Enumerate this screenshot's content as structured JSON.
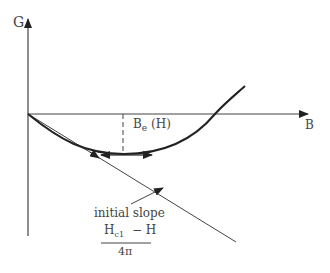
{
  "diagram": {
    "y_axis_label": "G",
    "x_axis_label": "B",
    "curve_label_main": "B",
    "curve_label_sub": "e",
    "curve_label_arg": "(H)",
    "slope_title": "initial slope",
    "slope_num_a": "H",
    "slope_num_a_sub": "c1",
    "slope_num_op": "− H",
    "slope_den": "4π"
  },
  "colors": {
    "line": "#222222",
    "thin_line": "#444444",
    "text": "#444444"
  }
}
